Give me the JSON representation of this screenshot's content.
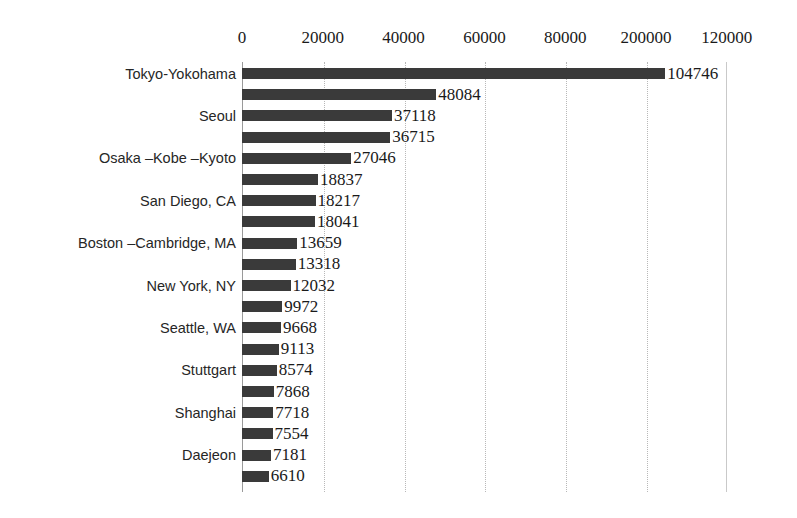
{
  "chart_data": {
    "type": "bar",
    "orientation": "horizontal",
    "title": "",
    "xlabel": "",
    "ylabel": "",
    "xlim": [
      0,
      120000
    ],
    "grid": true,
    "legend": false,
    "tick_labels": [
      "0",
      "20000",
      "40000",
      "60000",
      "80000",
      "200000",
      "120000"
    ],
    "tick_values": [
      0,
      20000,
      40000,
      60000,
      80000,
      100000,
      120000
    ],
    "categories": [
      "Tokyo-Yokohama",
      "",
      "Seoul",
      "",
      "Osaka –Kobe –Kyoto",
      "",
      "San Diego, CA",
      "",
      "Boston –Cambridge, MA",
      "",
      "New York, NY",
      "",
      "Seattle, WA",
      "",
      "Stuttgart",
      "",
      "Shanghai",
      "",
      "Daejeon",
      ""
    ],
    "values": [
      104746,
      48084,
      37118,
      36715,
      27046,
      18837,
      18217,
      18041,
      13659,
      13318,
      12032,
      9972,
      9668,
      9113,
      8574,
      7868,
      7718,
      7554,
      7181,
      6610
    ],
    "value_labels": [
      "104746",
      "48084",
      "37118",
      "36715",
      "27046",
      "18837",
      "18217",
      "18041",
      "13659",
      "13318",
      "12032",
      "9972",
      "9668",
      "9113",
      "8574",
      "7868",
      "7718",
      "7554",
      "7181",
      "6610"
    ],
    "bar_color": "#3a3a3a",
    "background_color": "#ffffff",
    "gridline_color": "#b8b8b8"
  }
}
